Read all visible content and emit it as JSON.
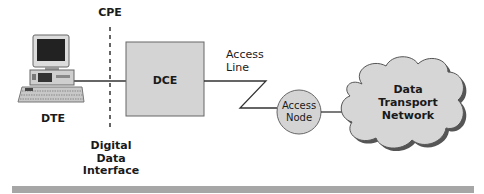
{
  "diagram": {
    "labels": {
      "cpe": "CPE",
      "dte": "DTE",
      "dce": "DCE",
      "access_line": [
        "Access",
        "Line"
      ],
      "access_node": [
        "Access",
        "Node"
      ],
      "network": [
        "Data",
        "Transport",
        "Network"
      ],
      "interface": [
        "Digital",
        "Data",
        "Interface"
      ]
    },
    "colors": {
      "box_fill": "#d4d4d4",
      "line": "#333333",
      "cloud_fill": "#d6d6d6",
      "node_fill": "#d4d4d4",
      "bar": "#a6a6a6"
    }
  }
}
